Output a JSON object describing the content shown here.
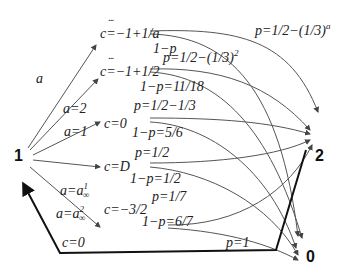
{
  "nodes": {
    "start": "1",
    "two": "2",
    "zero": "0"
  },
  "edge_labels_from_1": [
    {
      "label": "a"
    },
    {
      "label": "a=2"
    },
    {
      "label": "a=1"
    },
    {
      "label": "a=a",
      "sup": "1",
      "sub": "∞"
    },
    {
      "label": "a=a",
      "sup": "2",
      "sub": "∞"
    }
  ],
  "states": [
    {
      "label": "c=−1+1/a",
      "p": "p=1/2−(1/3)",
      "p_sup": "a",
      "q": "1−p"
    },
    {
      "label": "c=−1+1/2",
      "p": "p=1/2−(1/3)",
      "p_sup": "2",
      "q": "1−p=11/18"
    },
    {
      "label": "c=0",
      "p": "p=1/2−1/3",
      "q": "1−p=5/6"
    },
    {
      "label": "c=D",
      "p": "p=1/2",
      "q": "1−p=1/2"
    },
    {
      "label": "c=−3/2",
      "p": "p=1/7",
      "q": "1−p=6/7"
    }
  ],
  "ellipses": [
    "...",
    "..."
  ],
  "bottom_path": {
    "label_left": "c=0",
    "label_right": "p=1"
  }
}
